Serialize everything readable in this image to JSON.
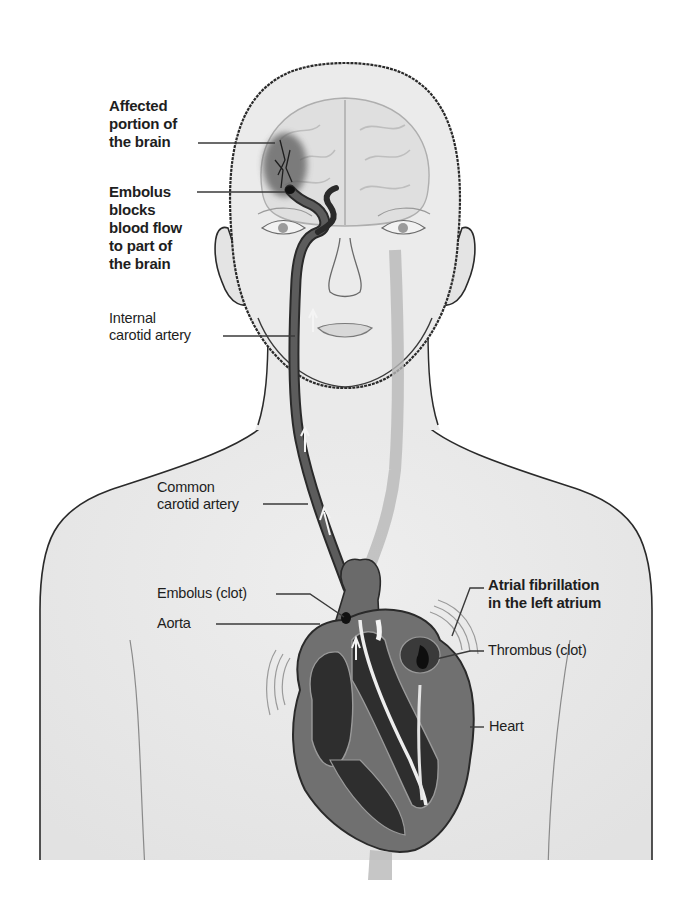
{
  "diagram": {
    "colors": {
      "background": "#ffffff",
      "skin_fill": "#ececec",
      "outline": "#2a2a2a",
      "artery_dark": "#4a4a4a",
      "heart_wall": "#6e6e6e",
      "heart_chamber": "#2e2e2e",
      "affected_brain": "#5a5a5a",
      "label_text": "#1e1e1e"
    },
    "labels": {
      "affected_brain": "Affected\nportion of\nthe brain",
      "embolus_blocks": "Embolus\nblocks\nblood flow\nto part of\nthe brain",
      "internal_carotid": "Internal\ncarotid artery",
      "common_carotid": "Common\ncarotid artery",
      "embolus_clot": "Embolus (clot)",
      "aorta": "Aorta",
      "atrial_fibrillation": "Atrial fibrillation\nin the left atrium",
      "thrombus": "Thrombus (clot)",
      "heart": "Heart"
    }
  }
}
